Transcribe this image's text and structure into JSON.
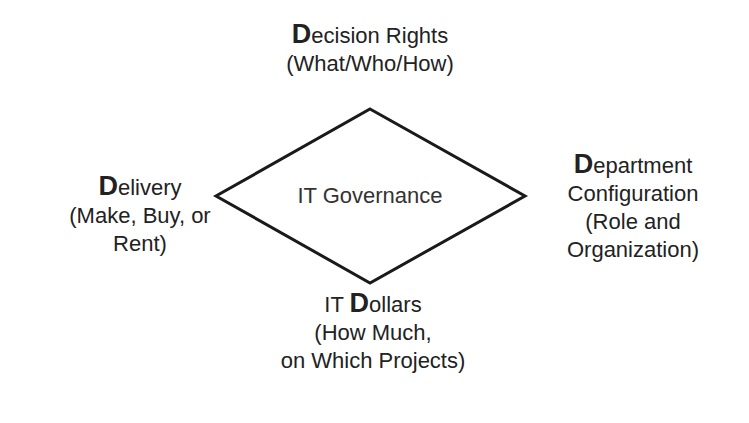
{
  "diagram": {
    "center": {
      "label": "IT Governance"
    },
    "nodes": {
      "top": {
        "initial": "D",
        "rest": "ecision Rights",
        "subtitle": "(What/Who/How)"
      },
      "left": {
        "initial": "D",
        "rest": "elivery",
        "subtitle_line1": "(Make, Buy, or",
        "subtitle_line2": "Rent)"
      },
      "right": {
        "initial": "D",
        "rest": "epartment",
        "line2": "Configuration",
        "line3": "(Role and",
        "line4": "Organization)"
      },
      "bottom": {
        "prefix": "IT ",
        "initial": "D",
        "rest": "ollars",
        "subtitle_line1": "(How Much,",
        "subtitle_line2": "on Which Projects)"
      }
    },
    "colors": {
      "stroke": "#1a1a1a",
      "text": "#222222",
      "background": "#ffffff"
    }
  }
}
